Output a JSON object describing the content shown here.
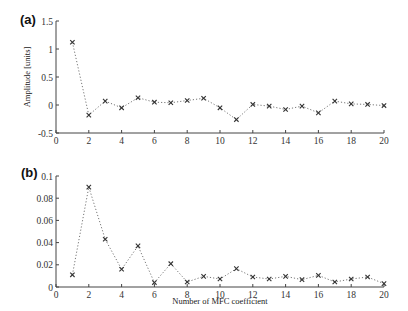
{
  "chart_data": [
    {
      "panel": "(a)",
      "type": "line",
      "title": "",
      "xlabel": "",
      "ylabel": "Amplitude [units]",
      "xlim": [
        0,
        20
      ],
      "ylim": [
        -0.5,
        1.5
      ],
      "xticks": [
        0,
        2,
        4,
        6,
        8,
        10,
        12,
        14,
        16,
        18,
        20
      ],
      "yticks": [
        -0.5,
        0,
        0.5,
        1,
        1.5
      ],
      "ytick_labels": [
        "-0.5",
        "0",
        "0.5",
        "1",
        "1.5"
      ],
      "grid": false,
      "legend": null,
      "line_style": "dotted",
      "marker": "x",
      "x": [
        1,
        2,
        3,
        4,
        5,
        6,
        7,
        8,
        9,
        10,
        11,
        12,
        13,
        14,
        15,
        16,
        17,
        18,
        19,
        20
      ],
      "values": [
        1.12,
        -0.18,
        0.07,
        -0.05,
        0.13,
        0.05,
        0.04,
        0.08,
        0.12,
        -0.05,
        -0.26,
        0.01,
        -0.02,
        -0.08,
        -0.02,
        -0.14,
        0.07,
        0.02,
        0.01,
        -0.01
      ]
    },
    {
      "panel": "(b)",
      "type": "line",
      "title": "",
      "xlabel": "Number of MFC coefficient",
      "ylabel": "",
      "xlim": [
        0,
        20
      ],
      "ylim": [
        0,
        0.1
      ],
      "xticks": [
        0,
        2,
        4,
        6,
        8,
        10,
        12,
        14,
        16,
        18,
        20
      ],
      "yticks": [
        0,
        0.02,
        0.04,
        0.06,
        0.08,
        0.1
      ],
      "ytick_labels": [
        "0",
        "0.02",
        "0.04",
        "0.06",
        "0.08",
        "0.1"
      ],
      "grid": false,
      "legend": null,
      "line_style": "dotted",
      "marker": "x",
      "x": [
        1,
        2,
        3,
        4,
        5,
        6,
        7,
        8,
        9,
        10,
        11,
        12,
        13,
        14,
        15,
        16,
        17,
        18,
        19,
        20
      ],
      "values": [
        0.011,
        0.09,
        0.043,
        0.016,
        0.037,
        0.004,
        0.021,
        0.0045,
        0.0096,
        0.0072,
        0.0165,
        0.009,
        0.0072,
        0.0096,
        0.0066,
        0.0105,
        0.0045,
        0.0072,
        0.009,
        0.003
      ]
    }
  ],
  "panels": [
    {
      "label": "(a)",
      "frame": {
        "x0": 56,
        "x1": 384,
        "y_top": 21,
        "y_bottom": 133
      },
      "label_pos": {
        "x": 20,
        "y": 24
      },
      "ylabel_pos": {
        "x": 30,
        "y": 77
      }
    },
    {
      "label": "(b)",
      "frame": {
        "x0": 56,
        "x1": 384,
        "y_top": 176,
        "y_bottom": 287
      },
      "label_pos": {
        "x": 21,
        "y": 177
      },
      "xlabel_pos": {
        "x": 220,
        "y": 304
      }
    }
  ],
  "colors": {
    "axis": "#444444",
    "line": "#777777",
    "marker": "#333333"
  }
}
